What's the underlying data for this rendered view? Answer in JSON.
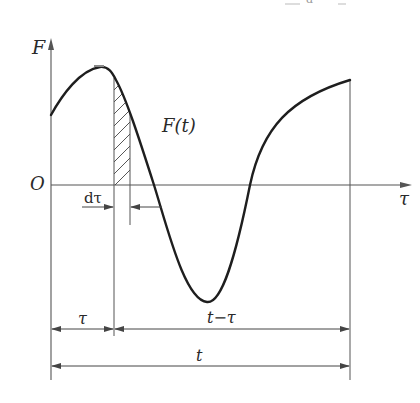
{
  "diagram": {
    "title_fragment": "d",
    "axis_y_label": "F",
    "axis_x_label": "τ",
    "origin_label": "O",
    "curve_label": "F(t)",
    "strip_width_label": "dτ",
    "dim_tau_label": "τ",
    "dim_t_minus_tau_label": "t−τ",
    "dim_t_label": "t",
    "colors": {
      "curve": "#1e1e1e",
      "axis": "#555555",
      "hatch": "#444444",
      "text": "#2a2a2a",
      "background": "#ffffff"
    }
  }
}
